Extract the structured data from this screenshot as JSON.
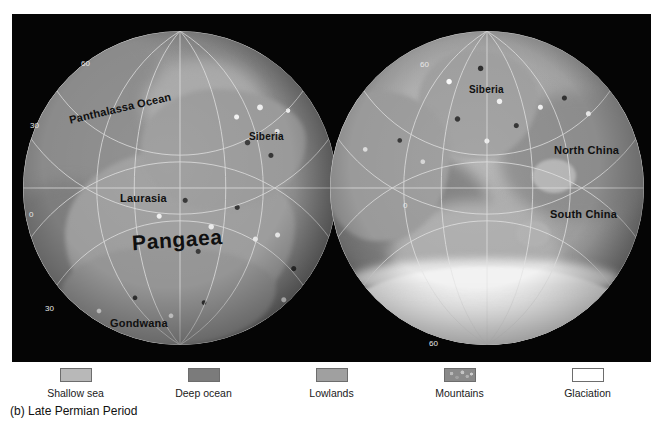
{
  "figure": {
    "caption": "(b) Late Permian Period",
    "background_color": "#050505",
    "page_background": "#ffffff"
  },
  "globes": [
    {
      "id": "globe-left",
      "name": "western-hemisphere-globe",
      "labels": [
        {
          "text": "Panthalassa Ocean",
          "size": "md",
          "x": 56,
          "y": 88,
          "rotate": -13
        },
        {
          "text": "Siberia",
          "size": "sm",
          "x": 237,
          "y": 117,
          "rotate": 0
        },
        {
          "text": "Laurasia",
          "size": "md",
          "x": 108,
          "y": 178,
          "rotate": 0
        },
        {
          "text": "Pangaea",
          "size": "big",
          "x": 120,
          "y": 214,
          "rotate": -4
        },
        {
          "text": "Gondwana",
          "size": "md",
          "x": 98,
          "y": 303,
          "rotate": 0
        }
      ],
      "grid_labels": [
        {
          "text": "60",
          "x": 69,
          "y": 45
        },
        {
          "text": "30",
          "x": 18,
          "y": 107
        },
        {
          "text": "0",
          "x": 17,
          "y": 196
        },
        {
          "text": "30",
          "x": 33,
          "y": 290
        }
      ]
    },
    {
      "id": "globe-right",
      "name": "eastern-hemisphere-globe",
      "labels": [
        {
          "text": "Siberia",
          "size": "sm",
          "x": 457,
          "y": 70,
          "rotate": 0
        },
        {
          "text": "North China",
          "size": "md",
          "x": 542,
          "y": 130,
          "rotate": 0
        },
        {
          "text": "South China",
          "size": "md",
          "x": 538,
          "y": 194,
          "rotate": 0
        }
      ],
      "grid_labels": [
        {
          "text": "60",
          "x": 408,
          "y": 46
        },
        {
          "text": "0",
          "x": 391,
          "y": 187
        },
        {
          "text": "30",
          "x": 407,
          "y": 266
        },
        {
          "text": "60",
          "x": 417,
          "y": 325
        }
      ]
    }
  ],
  "legend": {
    "name": "map-legend",
    "items": [
      {
        "label": "Shallow sea",
        "color": "#b8b8b8",
        "pattern": "solid"
      },
      {
        "label": "Deep ocean",
        "color": "#7b7b7b",
        "pattern": "solid"
      },
      {
        "label": "Lowlands",
        "color": "#a0a0a0",
        "pattern": "solid"
      },
      {
        "label": "Mountains",
        "color": "#8a8a8a",
        "pattern": "speckle"
      },
      {
        "label": "Glaciation",
        "color": "#ffffff",
        "pattern": "solid"
      }
    ]
  }
}
